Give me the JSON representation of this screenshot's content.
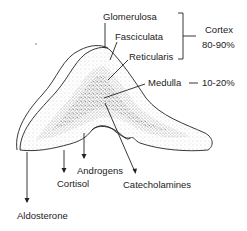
{
  "colors": {
    "ink": "#222222",
    "background": "#ffffff",
    "stipple_light": "#b8b8b8",
    "stipple_dark": "#8a8a8a"
  },
  "zones": {
    "glomerulosa": "Glomerulosa",
    "fasciculata": "Fasciculata",
    "reticularis": "Reticularis",
    "medulla": "Medulla"
  },
  "groups": {
    "cortex_label": "Cortex",
    "cortex_pct": "80-90%",
    "medulla_dash": "—",
    "medulla_pct": "10-20%"
  },
  "secretions": {
    "aldosterone": "Aldosterone",
    "cortisol": "Cortisol",
    "androgens": "Androgens",
    "catecholamines": "Catecholamines"
  }
}
